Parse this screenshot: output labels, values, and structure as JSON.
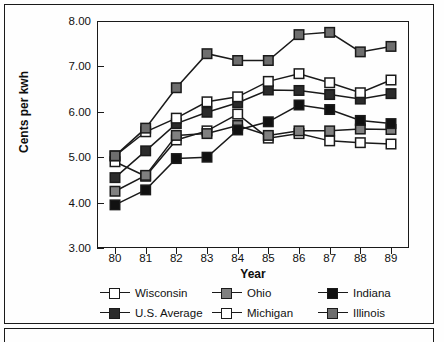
{
  "chart_data": {
    "type": "line",
    "title": "",
    "xlabel": "Year",
    "ylabel": "Cents per kwh",
    "categories": [
      "80",
      "81",
      "82",
      "83",
      "84",
      "85",
      "86",
      "87",
      "88",
      "89"
    ],
    "x": [
      80,
      81,
      82,
      83,
      84,
      85,
      86,
      87,
      88,
      89
    ],
    "ylim": [
      3.0,
      8.0
    ],
    "ytick_labels": [
      "3.00",
      "4.00",
      "5.00",
      "6.00",
      "7.00",
      "8.00"
    ],
    "yticks": [
      3.0,
      4.0,
      5.0,
      6.0,
      7.0,
      8.0
    ],
    "grid": false,
    "legend_position": "bottom",
    "series": [
      {
        "name": "Wisconsin",
        "marker": "open-square",
        "fill": "#ffffff",
        "values": [
          4.9,
          4.58,
          5.38,
          5.58,
          5.95,
          5.42,
          5.52,
          5.36,
          5.32,
          5.29
        ]
      },
      {
        "name": "Ohio",
        "marker": "gray-square",
        "fill": "#808080",
        "values": [
          4.25,
          4.6,
          5.48,
          5.52,
          5.7,
          5.48,
          5.58,
          5.58,
          5.62,
          5.61
        ]
      },
      {
        "name": "Indiana",
        "marker": "black-square",
        "fill": "#111111",
        "values": [
          3.95,
          4.28,
          4.97,
          5.0,
          5.6,
          5.78,
          6.15,
          6.05,
          5.81,
          5.74
        ]
      },
      {
        "name": "U.S. Average",
        "marker": "dark-square",
        "fill": "#2b2b2b",
        "values": [
          4.55,
          5.14,
          5.74,
          5.99,
          6.2,
          6.48,
          6.47,
          6.38,
          6.28,
          6.4
        ]
      },
      {
        "name": "Michigan",
        "marker": "open-square",
        "fill": "#ffffff",
        "values": [
          5.03,
          5.56,
          5.86,
          6.22,
          6.33,
          6.67,
          6.84,
          6.64,
          6.42,
          6.7
        ]
      },
      {
        "name": "Illinois",
        "marker": "gray-square",
        "fill": "#6e6e6e",
        "values": [
          5.03,
          5.64,
          6.53,
          7.28,
          7.13,
          7.13,
          7.7,
          7.75,
          7.32,
          7.44
        ]
      }
    ]
  },
  "legend": {
    "items": [
      {
        "label": "Wisconsin",
        "fill": "#ffffff"
      },
      {
        "label": "Ohio",
        "fill": "#808080"
      },
      {
        "label": "Indiana",
        "fill": "#111111"
      },
      {
        "label": "U.S. Average",
        "fill": "#2b2b2b"
      },
      {
        "label": "Michigan",
        "fill": "#ffffff"
      },
      {
        "label": "Illinois",
        "fill": "#6e6e6e"
      }
    ]
  },
  "colors": {
    "axis": "#1a1a1a",
    "line": "#1a1a1a",
    "background": "#fefefe"
  }
}
